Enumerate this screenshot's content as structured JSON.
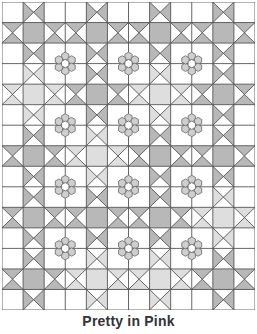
{
  "caption": "Pretty in Pink",
  "grid": {
    "columns": 12,
    "rows": 15,
    "column_types": [
      "plain",
      "sash",
      "block",
      "block",
      "sash",
      "block",
      "block",
      "sash",
      "block",
      "block",
      "sash",
      "plain"
    ],
    "row_types": [
      "plain",
      "sash",
      "block",
      "block",
      "sash",
      "block",
      "block",
      "sash",
      "block",
      "block",
      "sash",
      "block",
      "block",
      "sash",
      "plain"
    ]
  },
  "sash_intersections": {
    "rows": [
      1,
      4,
      7,
      10,
      13
    ],
    "cols": [
      1,
      4,
      7,
      10
    ],
    "shade": [
      [
        "dark",
        "dark",
        "dark",
        "dark"
      ],
      [
        "light",
        "dark",
        "light",
        "dark"
      ],
      [
        "dark",
        "light",
        "dark",
        "dark"
      ],
      [
        "dark",
        "dark",
        "dark",
        "light"
      ],
      [
        "dark",
        "light",
        "light",
        "dark"
      ]
    ]
  },
  "hexagon_flowers": {
    "block_rows": [
      2,
      5,
      8,
      11
    ],
    "block_cols": [
      2,
      5,
      8
    ],
    "count": 12,
    "petals": 6
  },
  "colors": {
    "background": "#ffffff",
    "line": "#555555",
    "dark_shade": "#b8b8b8",
    "light_shade": "#dedede",
    "petal": "#cfcfcf",
    "petal_stroke": "#666666"
  }
}
